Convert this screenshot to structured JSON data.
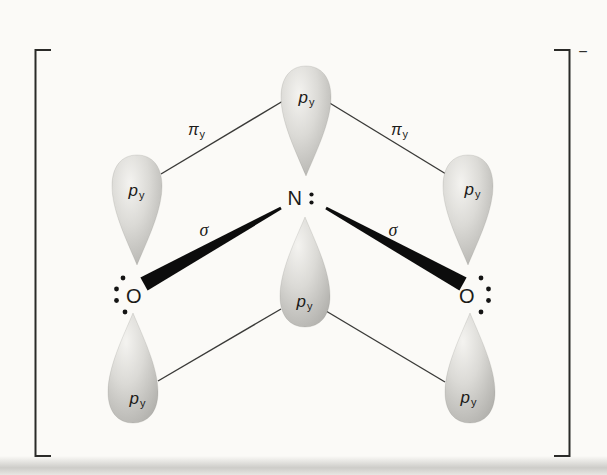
{
  "charge": "−",
  "atoms": {
    "nitrogen": "N",
    "oxygen_left": "O",
    "oxygen_right": "O"
  },
  "labels": {
    "p_orbital": {
      "base": "p",
      "sub": "y"
    },
    "pi_bond": {
      "base": "π",
      "sub": "y"
    },
    "sigma_bond": "σ"
  },
  "colors": {
    "background": "#fbfaf7",
    "ink": "#2a2a28",
    "orbital_highlight": "#f4f3f0",
    "orbital_mid": "#dbdad6",
    "orbital_shade": "#b1b0ac"
  }
}
